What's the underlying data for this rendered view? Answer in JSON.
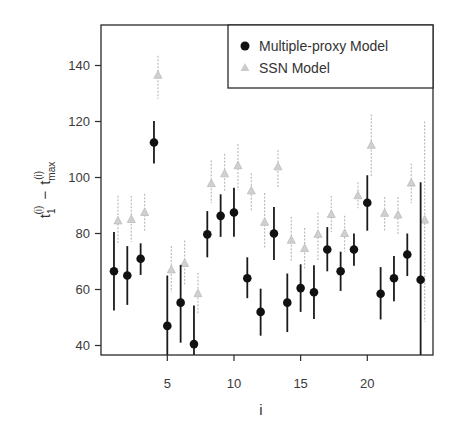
{
  "chart_data": {
    "type": "scatter",
    "title": "",
    "xlabel": "i",
    "ylabel": "t1(i) - tmax(i)",
    "ylabel_parts": {
      "t": "t",
      "sub1": "1",
      "sup": "(i)",
      "minus": "−",
      "submax": "max"
    },
    "xlim": [
      0.5,
      24.5
    ],
    "ylim": [
      35.5,
      154
    ],
    "xticks": [
      5,
      10,
      15,
      20
    ],
    "yticks": [
      40,
      60,
      80,
      100,
      120,
      140
    ],
    "grid": false,
    "legend_position": "top-right",
    "x": [
      1,
      2,
      3,
      4,
      5,
      6,
      7,
      8,
      9,
      10,
      11,
      12,
      13,
      14,
      15,
      16,
      17,
      18,
      19,
      20,
      21,
      22,
      23,
      24
    ],
    "series": [
      {
        "name": "Multiple-proxy Model",
        "marker": "circle",
        "color": "#111111",
        "values": [
          66.5,
          65,
          71,
          112.5,
          47,
          55.3,
          40.5,
          79.7,
          86.3,
          87.5,
          64,
          52,
          80,
          55.3,
          60.5,
          59,
          74.3,
          66.5,
          74.3,
          91,
          58.5,
          64,
          72.5,
          63.5
        ],
        "err_low": [
          52.5,
          54.5,
          65.2,
          105,
          35.5,
          41,
          35.5,
          71.5,
          78.8,
          78.8,
          56.9,
          43.5,
          70.5,
          44.8,
          52,
          49.5,
          66.5,
          59.5,
          68.5,
          81,
          49.3,
          55.8,
          64.8,
          35.5
        ],
        "err_high": [
          80.5,
          75.5,
          76.5,
          120.2,
          65,
          68.8,
          54.3,
          88,
          94,
          96.3,
          71.5,
          60.3,
          89.5,
          65.7,
          69,
          68.7,
          82.3,
          73.5,
          80,
          100.8,
          68,
          72,
          80,
          98.3
        ]
      },
      {
        "name": "SSN Model",
        "marker": "triangle",
        "color": "#bdbdbd",
        "values": [
          84.5,
          85,
          87.5,
          136.5,
          67,
          69.3,
          58.5,
          97.8,
          101.3,
          104.2,
          95.2,
          84,
          103.8,
          77.6,
          74.6,
          79.7,
          86.8,
          80,
          93.5,
          111.5,
          87.2,
          86.6,
          98,
          84.8
        ],
        "err_low": [
          76.6,
          77,
          81,
          128,
          59,
          61.5,
          51.5,
          90.8,
          95.3,
          95.5,
          88.3,
          75,
          96,
          69.8,
          67,
          70,
          80.5,
          73.5,
          89,
          100.5,
          80.5,
          79.8,
          90.8,
          48.5
        ],
        "err_high": [
          93.5,
          93.5,
          94.2,
          143.5,
          75.5,
          77.5,
          66,
          106.2,
          108.5,
          112,
          101.5,
          94.5,
          109.8,
          86,
          82,
          87.5,
          93.5,
          86.3,
          98.3,
          122.5,
          93,
          93,
          105,
          120
        ]
      }
    ]
  },
  "legend": {
    "items": [
      {
        "label": "Multiple-proxy Model"
      },
      {
        "label": "SSN Model"
      }
    ]
  },
  "axes": {
    "x_title": "i",
    "y_tick_labels": [
      "40",
      "60",
      "80",
      "100",
      "120",
      "140"
    ],
    "x_tick_labels": [
      "5",
      "10",
      "15",
      "20"
    ]
  }
}
